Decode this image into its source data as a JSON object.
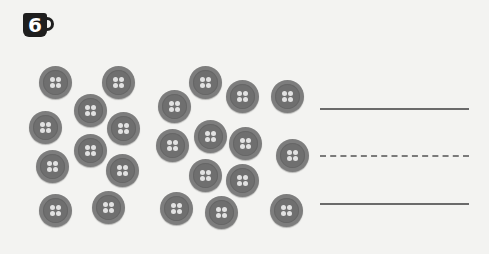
{
  "exercise": {
    "number": "6",
    "badge_icon": "mug-icon"
  },
  "groups": [
    {
      "name": "left-group",
      "count": 10,
      "buttons": [
        [
          39,
          66
        ],
        [
          102,
          66
        ],
        [
          74,
          94
        ],
        [
          29,
          111
        ],
        [
          107,
          112
        ],
        [
          74,
          134
        ],
        [
          36,
          150
        ],
        [
          106,
          154
        ],
        [
          39,
          194
        ],
        [
          92,
          191
        ]
      ]
    },
    {
      "name": "right-group",
      "count": 13,
      "buttons": [
        [
          189,
          66
        ],
        [
          226,
          80
        ],
        [
          271,
          80
        ],
        [
          158,
          90
        ],
        [
          156,
          129
        ],
        [
          194,
          120
        ],
        [
          229,
          127
        ],
        [
          276,
          139
        ],
        [
          189,
          159
        ],
        [
          226,
          164
        ],
        [
          160,
          192
        ],
        [
          205,
          196
        ],
        [
          270,
          194
        ]
      ]
    }
  ],
  "answer_lines": [
    {
      "style": "solid",
      "y": 108
    },
    {
      "style": "dashed",
      "y": 155
    },
    {
      "style": "solid",
      "y": 203
    }
  ],
  "colors": {
    "background": "#f3f3f1",
    "button": "#7d7d7d",
    "badge": "#1e1e1e"
  }
}
